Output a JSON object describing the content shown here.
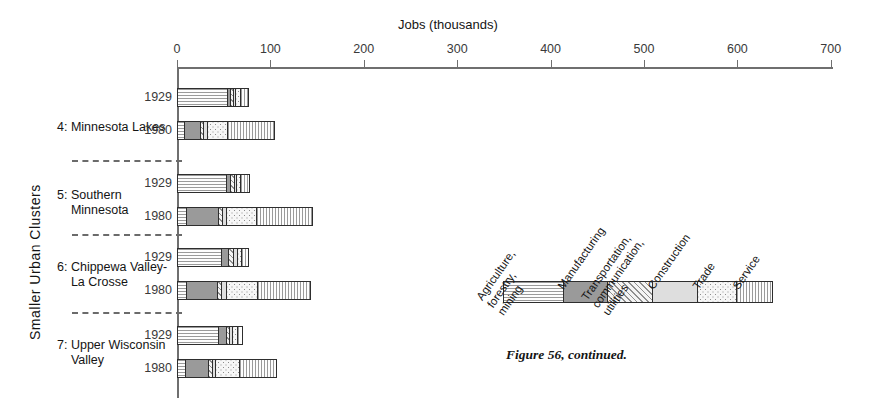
{
  "figure": {
    "caption": "Figure 56, continued.",
    "axis_title": "Jobs  (thousands)",
    "y_axis_title": "Smaller  Urban  Clusters"
  },
  "axis": {
    "ticks": [
      "0",
      "100",
      "200",
      "300",
      "400",
      "500",
      "600",
      "700"
    ]
  },
  "legend": {
    "items": [
      {
        "label": "Agriculture,\nforestry,\nmining",
        "pattern": "horizontal-lines",
        "color": "#f7f7f7"
      },
      {
        "label": "Manufacturing",
        "pattern": "solid-dark-gray",
        "color": "#9a9a9a"
      },
      {
        "label": "Transportation,\ncommunication,\nutilities",
        "pattern": "diagonal-hatch",
        "color": "#ececec"
      },
      {
        "label": "Construction",
        "pattern": "solid-light-gray",
        "color": "#dedede"
      },
      {
        "label": "Trade",
        "pattern": "dots",
        "color": "#f6f6f6"
      },
      {
        "label": "Service",
        "pattern": "vertical-lines",
        "color": "#fafafa"
      }
    ]
  },
  "chart_data": {
    "type": "bar",
    "orientation": "horizontal",
    "stacked": true,
    "title": "",
    "xlabel": "Jobs  (thousands)",
    "ylabel": "Smaller  Urban  Clusters",
    "xlim": [
      0,
      730
    ],
    "xticks": [
      0,
      100,
      200,
      300,
      400,
      500,
      600,
      700
    ],
    "grid": false,
    "legend_position": "right-panel",
    "series": [
      {
        "name": "Agriculture, forestry, mining"
      },
      {
        "name": "Manufacturing"
      },
      {
        "name": "Transportation, communication, utilities"
      },
      {
        "name": "Construction"
      },
      {
        "name": "Trade"
      },
      {
        "name": "Service"
      }
    ],
    "groups": [
      {
        "label": "4: Minnesota Lakes",
        "bars": [
          {
            "year": "1929",
            "total": 75,
            "values": [
              53,
              4,
              3,
              2,
              5,
              8
            ]
          },
          {
            "year": "1980",
            "total": 103,
            "values": [
              8,
              17,
              3,
              4,
              22,
              49
            ]
          }
        ]
      },
      {
        "label": "5: Southern\n    Minnesota",
        "bars": [
          {
            "year": "1929",
            "total": 76,
            "values": [
              52,
              5,
              4,
              2,
              5,
              8
            ]
          },
          {
            "year": "1980",
            "total": 143,
            "values": [
              10,
              34,
              4,
              5,
              32,
              58
            ]
          }
        ]
      },
      {
        "label": "6: Chippewa Valley-\n    La Crosse",
        "bars": [
          {
            "year": "1929",
            "total": 75,
            "values": [
              47,
              8,
              5,
              4,
              5,
              6
            ]
          },
          {
            "year": "1980",
            "total": 141,
            "values": [
              10,
              33,
              4,
              5,
              34,
              55
            ]
          }
        ]
      },
      {
        "label": "7: Upper Wisconsin\n    Valley",
        "bars": [
          {
            "year": "1929",
            "total": 68,
            "values": [
              44,
              8,
              4,
              3,
              5,
              4
            ]
          },
          {
            "year": "1980",
            "total": 105,
            "values": [
              9,
              24,
              4,
              4,
              25,
              39
            ]
          }
        ]
      }
    ]
  }
}
